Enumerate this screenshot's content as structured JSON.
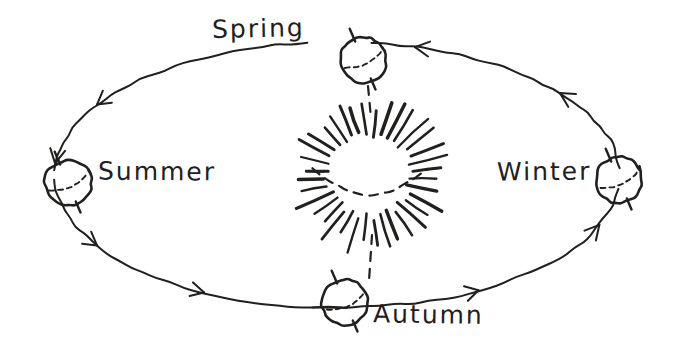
{
  "diagram": {
    "style": "hand-drawn sketch",
    "background_color": "#ffffff",
    "ink_color": "#22201e",
    "width": 675,
    "height": 355
  },
  "sun": {
    "name": "Sun",
    "center_x": 370,
    "center_y": 175,
    "ray_count": 36,
    "inner_radius": 42,
    "outer_radius": 72,
    "has_dashed_arc": true
  },
  "orbit": {
    "shape": "ellipse",
    "center_x": 337,
    "center_y": 175,
    "radius_x": 283,
    "radius_y": 133,
    "direction": "counterclockwise",
    "arrow_count": 6
  },
  "seasons": [
    {
      "id": "spring",
      "label": "Spring",
      "position": "top",
      "globe_x": 363,
      "globe_y": 60,
      "globe_r": 23,
      "label_x": 212,
      "label_y": 14,
      "axis_tilt_deg": -23,
      "connected_to_sun": true
    },
    {
      "id": "summer",
      "label": "Summer",
      "position": "left",
      "globe_x": 68,
      "globe_y": 183,
      "globe_r": 23,
      "label_x": 98,
      "label_y": 157,
      "axis_tilt_deg": -23,
      "connected_to_sun": false
    },
    {
      "id": "autumn",
      "label": "Autumn",
      "position": "bottom",
      "globe_x": 345,
      "globe_y": 302,
      "globe_r": 23,
      "label_x": 373,
      "label_y": 300,
      "axis_tilt_deg": -23,
      "connected_to_sun": true
    },
    {
      "id": "winter",
      "label": "Winter",
      "position": "right",
      "globe_x": 619,
      "globe_y": 180,
      "globe_r": 23,
      "label_x": 497,
      "label_y": 157,
      "axis_tilt_deg": -23,
      "connected_to_sun": false
    }
  ],
  "flow_sequence": [
    "Spring",
    "Summer",
    "Autumn",
    "Winter"
  ]
}
